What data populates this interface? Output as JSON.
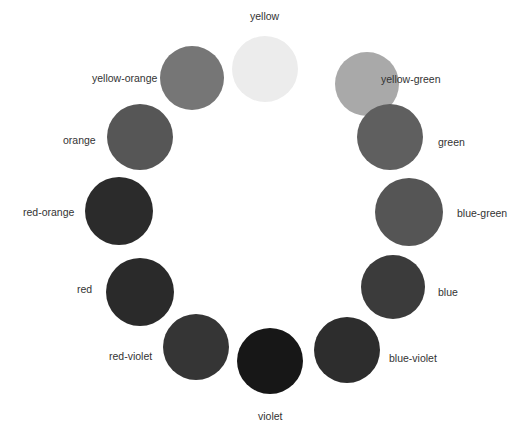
{
  "diagram": {
    "type": "color-wheel",
    "swatches": [
      {
        "name": "yellow",
        "cx": 265,
        "cy": 69,
        "r": 33,
        "color": "#ececec",
        "label_x": 250,
        "label_y": 10
      },
      {
        "name": "yellow-green",
        "cx": 367,
        "cy": 84,
        "r": 32,
        "color": "#a9a9a9",
        "label_x": 381,
        "label_y": 73
      },
      {
        "name": "green",
        "cx": 390,
        "cy": 137,
        "r": 33,
        "color": "#5f5f5f",
        "label_x": 438,
        "label_y": 136
      },
      {
        "name": "blue-green",
        "cx": 409,
        "cy": 212,
        "r": 34,
        "color": "#555555",
        "label_x": 457,
        "label_y": 207
      },
      {
        "name": "blue",
        "cx": 393,
        "cy": 287,
        "r": 32,
        "color": "#3b3b3b",
        "label_x": 438,
        "label_y": 286
      },
      {
        "name": "blue-violet",
        "cx": 347,
        "cy": 350,
        "r": 33,
        "color": "#2d2d2d",
        "label_x": 389,
        "label_y": 352
      },
      {
        "name": "violet",
        "cx": 270,
        "cy": 361,
        "r": 33,
        "color": "#171717",
        "label_x": 258,
        "label_y": 410
      },
      {
        "name": "red-violet",
        "cx": 196,
        "cy": 347,
        "r": 33,
        "color": "#353535",
        "label_x": 109,
        "label_y": 350
      },
      {
        "name": "red",
        "cx": 140,
        "cy": 292,
        "r": 34,
        "color": "#2a2a2a",
        "label_x": 77,
        "label_y": 283
      },
      {
        "name": "red-orange",
        "cx": 119,
        "cy": 211,
        "r": 34,
        "color": "#2b2b2b",
        "label_x": 23,
        "label_y": 206
      },
      {
        "name": "orange",
        "cx": 140,
        "cy": 137,
        "r": 33,
        "color": "#565656",
        "label_x": 63,
        "label_y": 134
      },
      {
        "name": "yellow-orange",
        "cx": 192,
        "cy": 78,
        "r": 32,
        "color": "#767676",
        "label_x": 92,
        "label_y": 72
      }
    ]
  }
}
